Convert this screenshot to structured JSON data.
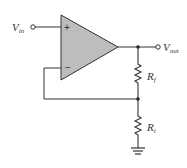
{
  "diagram": {
    "labels": {
      "vin": "V",
      "vin_sub": "in",
      "vout": "V",
      "vout_sub": "out",
      "rf": "R",
      "rf_sub": "f",
      "ri": "R",
      "ri_sub": "i",
      "plus": "+",
      "minus": "−"
    },
    "colors": {
      "opamp_fill": "#bdbdbd",
      "wire": "#333333",
      "background": "#ffffff"
    }
  }
}
